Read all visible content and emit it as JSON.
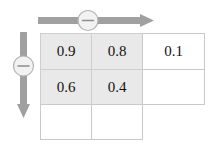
{
  "figure": {
    "name": "grid-with-minus-sliders",
    "background_color": "#ffffff",
    "grid_line_color": "#c9c9c9",
    "shaded_cell_color": "#e9e9e9",
    "arrow_color": "#a0a0a0",
    "knob_fill_color": "#f2f2f2",
    "knob_border_color": "#b5b5b5",
    "text_color": "#111111"
  },
  "controls": {
    "horizontal": {
      "label": "",
      "icon": "minus-icon",
      "symbol": "−",
      "direction": "right"
    },
    "vertical": {
      "label": "",
      "icon": "minus-icon",
      "symbol": "−",
      "direction": "down"
    }
  },
  "grid": {
    "rows": 3,
    "columns": 3,
    "cells": [
      [
        {
          "value": "0.9",
          "shaded": true
        },
        {
          "value": "0.8",
          "shaded": true
        },
        {
          "value": "0.1",
          "shaded": false
        }
      ],
      [
        {
          "value": "0.6",
          "shaded": true
        },
        {
          "value": "0.4",
          "shaded": true
        },
        {
          "value": "",
          "shaded": false
        }
      ],
      [
        {
          "value": "",
          "shaded": false
        },
        {
          "value": "",
          "shaded": false
        },
        {
          "value": "",
          "shaded": false
        }
      ]
    ]
  }
}
